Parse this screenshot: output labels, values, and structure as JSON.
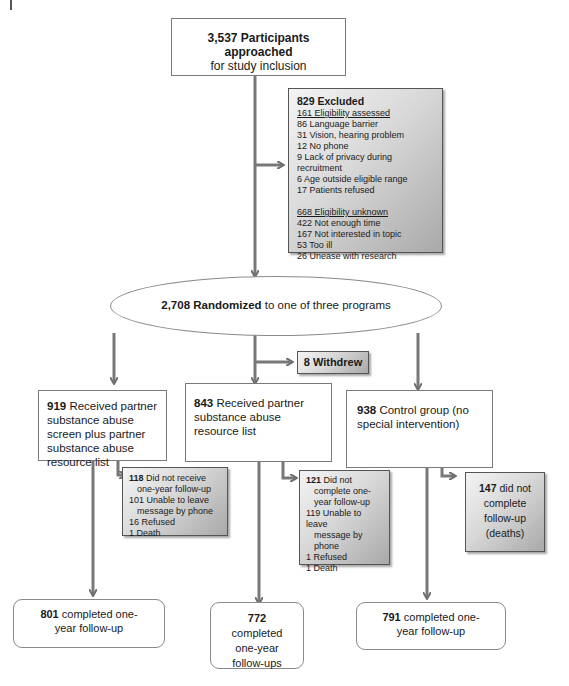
{
  "start": {
    "count": "3,537",
    "bold": "Participants approached",
    "rest": "for study inclusion"
  },
  "excluded": {
    "title": "829 Excluded",
    "assessed_header": "161 Eligibility assessed",
    "assessed": [
      "86 Language barrier",
      "31 Vision, hearing problem",
      "12 No phone",
      "9 Lack of privacy during recruitment",
      "6 Age outside eligible range",
      "17 Patients refused"
    ],
    "unknown_header": "668 Eligibility unknown",
    "unknown": [
      "422 Not enough time",
      "167 Not interested in topic",
      "53 Too ill",
      "26 Unease with research"
    ]
  },
  "randomized": {
    "count": "2,708",
    "bold": "Randomized",
    "rest": "to one of three programs"
  },
  "withdrew": {
    "label": "8 Withdrew"
  },
  "arms": [
    {
      "count": "919",
      "text": "Received partner substance abuse screen plus partner substance abuse resource list"
    },
    {
      "count": "843",
      "text": "Received partner substance abuse resource list"
    },
    {
      "count": "938",
      "text": "Control group (no special intervention)"
    }
  ],
  "losses": [
    {
      "count": "118",
      "lines": [
        "Did not receive",
        "one-year follow-up",
        "101 Unable to leave",
        "message by phone",
        "16 Refused",
        "1 Death"
      ]
    },
    {
      "count": "121",
      "lines": [
        "Did not",
        "complete one-",
        "year follow-up",
        "119 Unable to leave",
        "message by",
        "phone",
        "1 Refused",
        "1 Death"
      ]
    },
    {
      "count": "147",
      "lines": [
        "did not",
        "complete",
        "follow-up",
        "(deaths)"
      ]
    }
  ],
  "completed": [
    {
      "count": "801",
      "text": "completed one-year follow-up"
    },
    {
      "count": "772",
      "text": "completed one-year follow-ups"
    },
    {
      "count": "791",
      "text": "completed one-year follow-up"
    }
  ]
}
